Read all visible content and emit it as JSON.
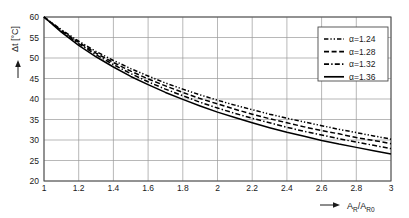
{
  "chart_data": {
    "type": "line",
    "title": "",
    "xlabel": "A_R /A_R0",
    "ylabel": "Δt [°C]",
    "xlim": [
      1,
      3
    ],
    "ylim": [
      20,
      60
    ],
    "grid": true,
    "legend_position": "top-right",
    "xticks": [
      "1",
      "1.2",
      "1.4",
      "1.6",
      "1.8",
      "2",
      "2.2",
      "2.4",
      "2.6",
      "2.8",
      "3"
    ],
    "xtick_values": [
      1,
      1.2,
      1.4,
      1.6,
      1.8,
      2,
      2.2,
      2.4,
      2.6,
      2.8,
      3
    ],
    "yticks": [
      "20",
      "25",
      "30",
      "35",
      "40",
      "45",
      "50",
      "55",
      "60"
    ],
    "ytick_values": [
      20,
      25,
      30,
      35,
      40,
      45,
      50,
      55,
      60
    ],
    "x": [
      1,
      1.1,
      1.2,
      1.3,
      1.4,
      1.5,
      1.6,
      1.7,
      1.8,
      1.9,
      2,
      2.1,
      2.2,
      2.3,
      2.4,
      2.5,
      2.6,
      2.7,
      2.8,
      2.9,
      3
    ],
    "series": [
      {
        "name": "α=1.24",
        "alpha": 1.24,
        "dash": "dash-dot-dot",
        "values": [
          60.0,
          56.9,
          54.1,
          51.6,
          49.4,
          47.4,
          45.6,
          43.9,
          42.4,
          41.0,
          39.7,
          38.5,
          37.4,
          36.3,
          35.3,
          34.4,
          33.5,
          32.6,
          31.8,
          31.0,
          30.2
        ]
      },
      {
        "name": "α=1.28",
        "alpha": 1.28,
        "dash": "dashed",
        "values": [
          60.0,
          56.7,
          53.8,
          51.2,
          48.9,
          46.8,
          44.9,
          43.2,
          41.6,
          40.1,
          38.8,
          37.5,
          36.3,
          35.2,
          34.2,
          33.2,
          32.3,
          31.5,
          30.6,
          29.9,
          29.1
        ]
      },
      {
        "name": "α=1.32",
        "alpha": 1.32,
        "dash": "dash-dot",
        "values": [
          60.0,
          56.5,
          53.5,
          50.8,
          48.4,
          46.2,
          44.2,
          42.4,
          40.8,
          39.2,
          37.8,
          36.5,
          35.3,
          34.2,
          33.1,
          32.1,
          31.2,
          30.3,
          29.5,
          28.7,
          27.9
        ]
      },
      {
        "name": "α=1.36",
        "alpha": 1.36,
        "dash": "solid",
        "values": [
          60.0,
          56.3,
          53.1,
          50.3,
          47.8,
          45.5,
          43.5,
          41.6,
          39.9,
          38.3,
          36.8,
          35.5,
          34.2,
          33.0,
          31.9,
          30.9,
          29.9,
          29.0,
          28.2,
          27.4,
          26.6
        ]
      }
    ]
  },
  "axes": {
    "y_title": "Δt [°C]",
    "x_title_main": "A",
    "x_title_sub1": "R",
    "x_title_mid": "/A",
    "x_title_sub2": "R0"
  },
  "legend": {
    "entries": [
      {
        "label": "α=1.24"
      },
      {
        "label": "α=1.28"
      },
      {
        "label": "α=1.32"
      },
      {
        "label": "α=1.36"
      }
    ]
  },
  "colors": {
    "curve": "#000000",
    "grid": "#9a9a9a",
    "frame": "#4a4a4a",
    "text": "#1a1a1a",
    "background": "#ffffff"
  }
}
